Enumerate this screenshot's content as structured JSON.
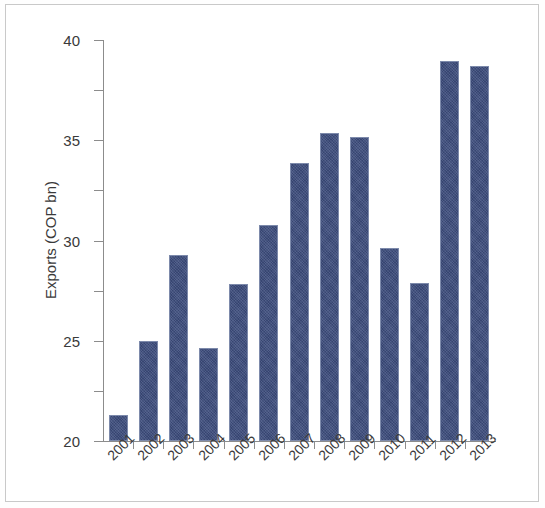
{
  "chart_data": {
    "type": "bar",
    "title": "",
    "subtitle": "",
    "xlabel": "",
    "ylabel": "Exports (COP bn)",
    "categories": [
      "2001",
      "2002",
      "2003",
      "2004",
      "2005",
      "2006",
      "2007",
      "2008",
      "2009",
      "2010",
      "2011",
      "2012",
      "2013"
    ],
    "values": [
      2.6,
      10.0,
      18.6,
      9.3,
      15.7,
      21.5,
      27.7,
      30.7,
      30.3,
      19.3,
      15.8,
      37.9,
      37.4
    ],
    "series": [
      {
        "name": "Exports (COP bn)",
        "values": [
          2.6,
          10.0,
          18.6,
          9.3,
          15.7,
          21.5,
          27.7,
          30.7,
          30.3,
          19.3,
          15.8,
          37.9,
          37.4
        ]
      }
    ],
    "ylim": [
      0,
      40
    ],
    "yticks": [
      0,
      5,
      10,
      15,
      20,
      25,
      30,
      35,
      40
    ],
    "ytick_labels": [
      "0",
      "5",
      "10",
      "15",
      "20",
      "25",
      "30",
      "35",
      "40"
    ],
    "grid": false,
    "legend": false,
    "legend_position": "none",
    "bar_color": "#3c4c7c",
    "bar_edge_color": "#7d8aab",
    "axis_color": "#8c8c8c",
    "text_color": "#3a3a3a",
    "xtick_label_rotation": -45,
    "frame_border_color": "#c9c9c9",
    "background": "#ffffff"
  }
}
